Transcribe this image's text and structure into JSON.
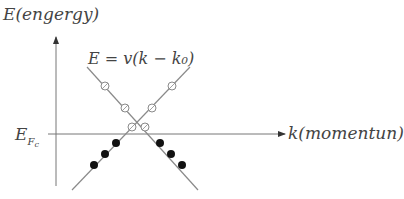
{
  "labels": {
    "energy_axis": "E(engergy)",
    "equation": "E = v(k − k₀)",
    "momentum_axis": "k(momentun)",
    "fermi_level_main": "E",
    "fermi_level_sub": "F",
    "fermi_level_subsub": "c"
  },
  "colors": {
    "line": "#8a8a8a",
    "axis": "#777777",
    "filled_dot": "#111111",
    "open_dot_stroke": "#8a8a8a",
    "text": "#444444"
  },
  "geometry": {
    "y_axis": {
      "x": 56,
      "y_top": 37,
      "y_bottom": 186
    },
    "x_axis": {
      "y": 134,
      "x_left": 48,
      "x_right": 285
    },
    "line_down": {
      "x1": 87,
      "y1": 67,
      "x2": 198,
      "y2": 190
    },
    "line_up": {
      "x1": 72,
      "y1": 190,
      "x2": 190,
      "y2": 67
    },
    "open_dots_line_down": [
      [
        105,
        86
      ],
      [
        125,
        108
      ],
      [
        145,
        127
      ]
    ],
    "open_dots_line_up": [
      [
        172,
        86
      ],
      [
        152,
        108
      ],
      [
        132,
        127
      ]
    ],
    "filled_dots_line_down": [
      [
        160,
        143
      ],
      [
        171,
        154
      ],
      [
        182,
        165
      ]
    ],
    "filled_dots_line_up": [
      [
        116,
        143
      ],
      [
        105,
        154
      ],
      [
        94,
        165
      ]
    ]
  }
}
